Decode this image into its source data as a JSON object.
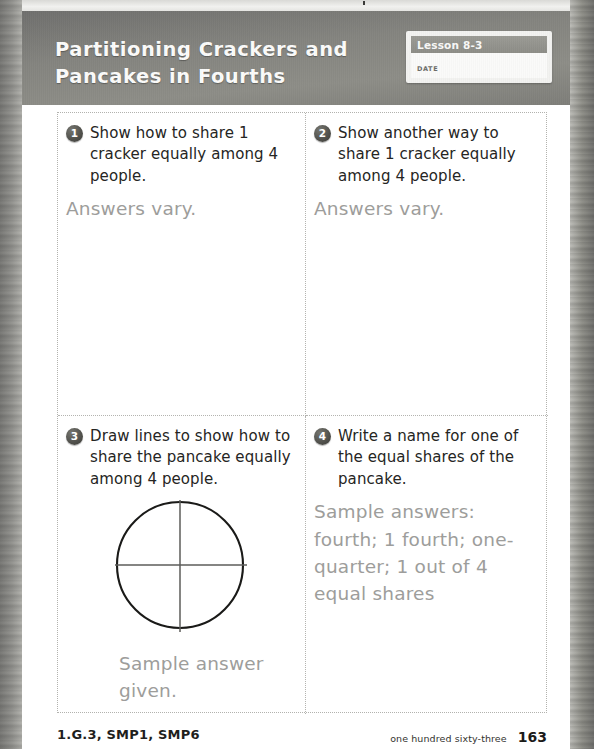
{
  "header": {
    "title": "Partitioning Crackers and Pancakes in Fourths",
    "lesson_label": "Lesson 8-3",
    "date_label": "DATE",
    "band_color": "#8d8d87"
  },
  "problems": [
    {
      "number": "1",
      "prompt": "Show how to share 1 cracker equally among 4 people.",
      "answer": "Answers vary."
    },
    {
      "number": "2",
      "prompt": "Show another way to share 1 cracker equally among 4 people.",
      "answer": "Answers vary."
    },
    {
      "number": "3",
      "prompt": "Draw lines to show how to share the pancake equally among 4 people.",
      "answer": "Sample answer given.",
      "figure": "circle-partitioned-in-fourths"
    },
    {
      "number": "4",
      "prompt": "Write a name for one of the equal shares of the pancake.",
      "answer": "Sample answers: fourth; 1 fourth; one-quarter; 1 out of 4 equal shares"
    }
  ],
  "footer": {
    "standards": "1.G.3, SMP1, SMP6",
    "page_words": "one hundred sixty-three",
    "page_number": "163"
  }
}
